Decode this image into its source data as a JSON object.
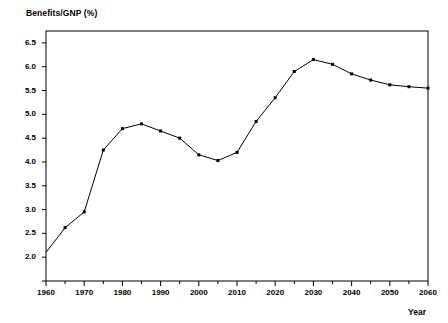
{
  "chart_data": {
    "type": "line",
    "title": "",
    "ylabel": "Benefits/GNP (%)",
    "xlabel": "Year",
    "xlim": [
      1960,
      2060
    ],
    "ylim": [
      1.5,
      6.75
    ],
    "grid": false,
    "legend": null,
    "marker": "square",
    "line_color": "#000000",
    "x_major_ticks": [
      1960,
      1970,
      1980,
      1990,
      2000,
      2010,
      2020,
      2030,
      2040,
      2050,
      2060
    ],
    "x_minor_ticks": [
      1965,
      1975,
      1985,
      1995,
      2005,
      2015,
      2025,
      2035,
      2045,
      2055
    ],
    "x_tick_labels": [
      "1960",
      "1970",
      "1980",
      "1990",
      "2000",
      "2010",
      "2020",
      "2030",
      "2040",
      "2050",
      "2060"
    ],
    "y_major_ticks": [
      2.0,
      2.5,
      3.0,
      3.5,
      4.0,
      4.5,
      5.0,
      5.5,
      6.0,
      6.5
    ],
    "y_tick_labels": [
      "2.0",
      "2.5",
      "3.0",
      "3.5",
      "4.0",
      "4.5",
      "5.0",
      "5.5",
      "6.0",
      "6.5"
    ],
    "y_unlabeled_ticks": [
      1.5
    ],
    "x": [
      1960,
      1965,
      1970,
      1975,
      1980,
      1985,
      1990,
      1995,
      2000,
      2005,
      2010,
      2015,
      2020,
      2025,
      2030,
      2035,
      2040,
      2045,
      2050,
      2055,
      2060
    ],
    "values": [
      2.1,
      2.62,
      2.95,
      4.25,
      4.7,
      4.8,
      4.65,
      4.5,
      4.15,
      4.03,
      4.2,
      4.85,
      5.35,
      5.9,
      6.15,
      6.05,
      5.85,
      5.72,
      5.62,
      5.58,
      5.55
    ]
  }
}
